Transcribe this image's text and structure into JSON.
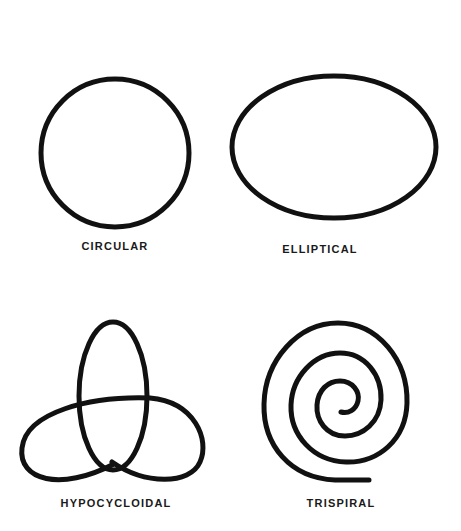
{
  "figures": [
    {
      "name": "circular",
      "label": "CIRCULAR"
    },
    {
      "name": "elliptical",
      "label": "ELLIPTICAL"
    },
    {
      "name": "hypocycloidal",
      "label": "HYPOCYCLOIDAL"
    },
    {
      "name": "trispiral",
      "label": "TRISPIRAL"
    }
  ],
  "colors": {
    "stroke": "#111111",
    "background": "#ffffff"
  }
}
